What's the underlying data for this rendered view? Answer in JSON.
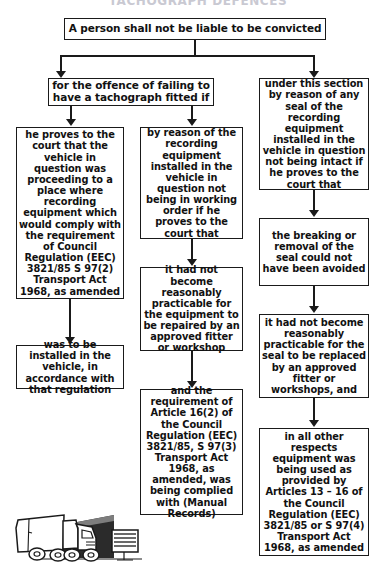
{
  "page": {
    "title_cutoff": "TACHOGRAPH DEFENCES",
    "bg_color": "#ffffff",
    "line_color": "#1a1a1a"
  },
  "flowchart": {
    "type": "flowchart",
    "root": {
      "id": "root",
      "text": "A person shall not be liable to be convicted"
    },
    "branches": [
      {
        "id": "branch-left",
        "text": "for the offence of failing to have a tachograph fitted if"
      },
      {
        "id": "branch-right",
        "text": "under this section by reason of any seal of the recording equipment installed in the vehicle in question not being intact if he proves to the court that"
      }
    ],
    "columns": [
      {
        "id": "column-1",
        "nodes": [
          {
            "id": "c1-n1",
            "text": "he proves to the court that the vehicle in question was proceeding to a place where recording equipment which would comply with the requirement of Council Regulation (EEC) 3821/85 S 97(2) Transport Act 1968, as amended"
          },
          {
            "id": "c1-n2",
            "text": "was to be installed in the vehicle, in accordance with that regulation"
          }
        ]
      },
      {
        "id": "column-2",
        "nodes": [
          {
            "id": "c2-n1",
            "text": "by reason of the recording equipment installed in the vehicle in question not being in working order if he proves to the court that"
          },
          {
            "id": "c2-n2",
            "text": "it had not become reasonably practicable for the equipment to be repaired by an approved fitter or workshop"
          },
          {
            "id": "c2-n3",
            "text": "and the requirement of Article 16(2) of the Council Regulation (EEC) 3821/85, S 97(3) Transport Act 1968, as amended, was being complied with (Manual Records)"
          }
        ]
      },
      {
        "id": "column-3",
        "nodes": [
          {
            "id": "c3-n1",
            "text": "the breaking or removal of the seal could not have been avoided"
          },
          {
            "id": "c3-n2",
            "text": "it had not become reasonably practicable for the seal to be replaced by an approved fitter or workshops, and"
          },
          {
            "id": "c3-n3",
            "text": "in all other respects equipment was being used as provided by Articles 13 – 16 of the Council Regulation (EEC) 3821/85 or S 97(4) Transport Act 1968, as amended"
          }
        ]
      }
    ],
    "illustration": {
      "id": "truck-illustration",
      "label": "lorry emerging from tunnel with roadside sign"
    }
  }
}
